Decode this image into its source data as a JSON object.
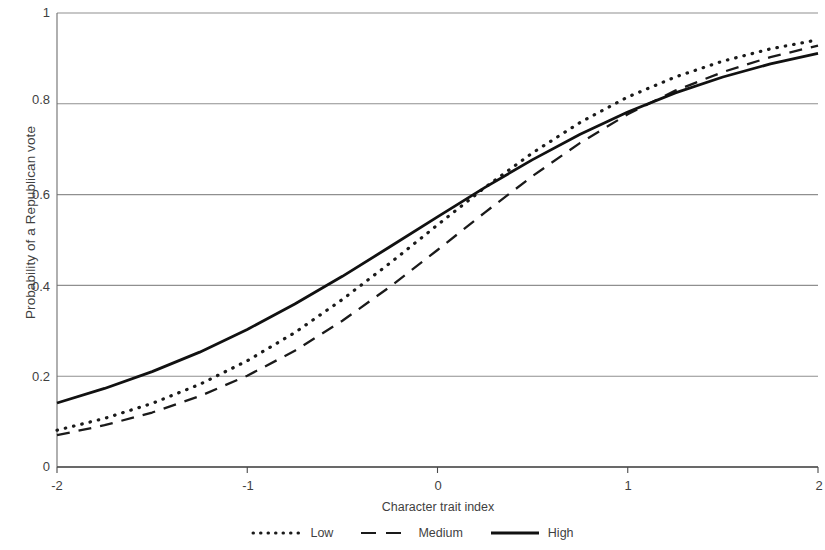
{
  "chart_data": {
    "type": "line",
    "title": "",
    "xlabel": "Character trait index",
    "ylabel": "Probability of a Republican vote",
    "xlim": [
      -2,
      2
    ],
    "ylim": [
      0,
      1
    ],
    "xticks": [
      "-2",
      "-1",
      "0",
      "1",
      "2"
    ],
    "xtick_values": [
      -2,
      -1,
      0,
      1,
      2
    ],
    "yticks": [
      "0",
      "0.2",
      "0.4",
      "0.6",
      "0.8",
      "1"
    ],
    "ytick_values": [
      0,
      0.2,
      0.4,
      0.6,
      0.8,
      1
    ],
    "grid": "horizontal",
    "legend_position": "bottom",
    "x": [
      -2,
      -1.75,
      -1.5,
      -1.25,
      -1,
      -0.75,
      -0.5,
      -0.25,
      0,
      0.25,
      0.5,
      0.75,
      1,
      1.25,
      1.5,
      1.75,
      2
    ],
    "series": [
      {
        "name": "Low",
        "style": "dotted",
        "color": "#1a1a1a",
        "values": [
          0.081,
          0.107,
          0.14,
          0.182,
          0.234,
          0.296,
          0.369,
          0.449,
          0.533,
          0.616,
          0.692,
          0.759,
          0.815,
          0.859,
          0.894,
          0.921,
          0.941
        ]
      },
      {
        "name": "Medium",
        "style": "dashed",
        "color": "#1a1a1a",
        "values": [
          0.07,
          0.092,
          0.12,
          0.156,
          0.201,
          0.256,
          0.322,
          0.397,
          0.478,
          0.561,
          0.641,
          0.714,
          0.777,
          0.829,
          0.87,
          0.903,
          0.928
        ]
      },
      {
        "name": "High",
        "style": "solid",
        "color": "#111111",
        "values": [
          0.141,
          0.173,
          0.21,
          0.253,
          0.303,
          0.359,
          0.42,
          0.485,
          0.551,
          0.616,
          0.677,
          0.733,
          0.782,
          0.824,
          0.859,
          0.888,
          0.911
        ]
      }
    ]
  },
  "legend": {
    "entries": [
      {
        "label": "Low",
        "marker": "dotted-line-swatch"
      },
      {
        "label": "Medium",
        "marker": "dashed-line-swatch"
      },
      {
        "label": "High",
        "marker": "solid-line-swatch"
      }
    ]
  }
}
